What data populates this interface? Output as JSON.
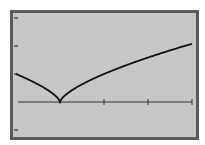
{
  "chart_data": {
    "type": "line",
    "title": "",
    "xlabel": "",
    "ylabel": "",
    "function": "y = x^(2/3)",
    "xlim": [
      -1,
      3
    ],
    "ylim": [
      -1,
      3
    ],
    "x_ticks": [
      1,
      2,
      3
    ],
    "y_ticks": [
      -1,
      1,
      2,
      3
    ],
    "grid": false,
    "legend": null,
    "series": [
      {
        "name": "y = x^(2/3)",
        "x": [
          -1,
          -0.75,
          -0.5,
          -0.25,
          -0.1,
          0,
          0.1,
          0.25,
          0.5,
          1,
          1.5,
          2,
          2.5,
          3
        ],
        "values": [
          1.0,
          0.83,
          0.63,
          0.4,
          0.22,
          0,
          0.22,
          0.4,
          0.63,
          1.0,
          1.31,
          1.59,
          1.84,
          2.08
        ]
      }
    ]
  },
  "screen": {
    "background": "#c6c6c4",
    "border_color": "#5a5a5a",
    "curve_color": "#111111",
    "axis_color": "#333333"
  }
}
